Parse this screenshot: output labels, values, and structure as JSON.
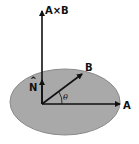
{
  "diagram": {
    "labels": {
      "cross": "A×B",
      "b": "B",
      "a": "A",
      "normal": "N",
      "normal_hat": "^",
      "angle": "θ"
    },
    "colors": {
      "plane_fill": "#a9a9a9",
      "plane_stroke": "#8a8a8a",
      "vector": "#111111"
    }
  }
}
